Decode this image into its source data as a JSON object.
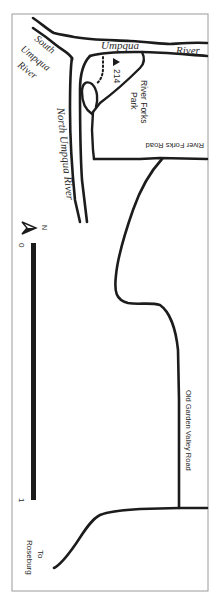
{
  "map": {
    "colors": {
      "ink": "#1c1c1c",
      "text": "#2a2a2a",
      "border": "#9a9a9a",
      "background": "#ffffff"
    },
    "rivers": {
      "umpqua_part1": "Umpqua",
      "umpqua_part2": "River",
      "south_umpqua_line1": "South",
      "south_umpqua_line2": "Umpqua",
      "south_umpqua_line3": "River",
      "north_umpqua": "North Umpqua River"
    },
    "park": {
      "name_line1": "River Forks",
      "name_line2": "Park",
      "trail_number": "214",
      "trailhead_icon": "triangle-marker"
    },
    "roads": {
      "river_forks_road": "River Forks Road",
      "old_garden_valley_road": "Old Garden Valley Road",
      "to_roseburg_line1": "To",
      "to_roseburg_line2": "Roseburg"
    },
    "scale": {
      "start_label": "0",
      "end_label": "1"
    },
    "north_arrow": {
      "label": "N"
    }
  }
}
